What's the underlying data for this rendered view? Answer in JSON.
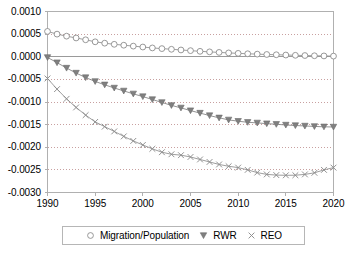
{
  "chart_data": {
    "type": "line",
    "title": "",
    "subtitle": "",
    "xlabel": "",
    "ylabel": "",
    "xlim": [
      1990,
      2020
    ],
    "ylim": [
      -0.003,
      0.001
    ],
    "grid": true,
    "legend_position": "bottom",
    "x": [
      1990,
      1991,
      1992,
      1993,
      1994,
      1995,
      1996,
      1997,
      1998,
      1999,
      2000,
      2001,
      2002,
      2003,
      2004,
      2005,
      2006,
      2007,
      2008,
      2009,
      2010,
      2011,
      2012,
      2013,
      2014,
      2015,
      2016,
      2017,
      2018,
      2019,
      2020
    ],
    "xticks": [
      1990,
      1995,
      2000,
      2005,
      2010,
      2015,
      2020
    ],
    "xtick_labels": [
      "1990",
      "1995",
      "2000",
      "2005",
      "2010",
      "2015",
      "2020"
    ],
    "yticks": [
      0.001,
      0.0005,
      0.0,
      -0.0005,
      -0.001,
      -0.0015,
      -0.002,
      -0.0025,
      -0.003
    ],
    "ytick_labels": [
      "0.0010",
      "0.0005",
      "0.0000",
      "-0.0005",
      "-0.0010",
      "-0.0015",
      "-0.0020",
      "-0.0025",
      "-0.0030"
    ],
    "series": [
      {
        "name": "Migration/Population",
        "marker": "open-circle",
        "color": "#8c8c8c",
        "values": [
          0.00056,
          0.0005,
          0.000455,
          0.000415,
          0.000375,
          0.00033,
          0.0003,
          0.000275,
          0.000255,
          0.000235,
          0.000215,
          0.000195,
          0.00018,
          0.000165,
          0.00015,
          0.000135,
          0.00012,
          0.000108,
          9.6e-05,
          8.5e-05,
          7.5e-05,
          6.6e-05,
          5.8e-05,
          5e-05,
          4.4e-05,
          3.8e-05,
          3.2e-05,
          2.7e-05,
          2.2e-05,
          1.8e-05,
          1.4e-05
        ]
      },
      {
        "name": "RWR",
        "marker": "filled-triangle-down",
        "color": "#808080",
        "values": [
          -1.5e-05,
          -0.00013,
          -0.00025,
          -0.00036,
          -0.00046,
          -0.000545,
          -0.00062,
          -0.00069,
          -0.000755,
          -0.00082,
          -0.00088,
          -0.000945,
          -0.00101,
          -0.001075,
          -0.00113,
          -0.00119,
          -0.001245,
          -0.0013,
          -0.00135,
          -0.001395,
          -0.001425,
          -0.001448,
          -0.001462,
          -0.001478,
          -0.001492,
          -0.001508,
          -0.00152,
          -0.00153,
          -0.00154,
          -0.001548,
          -0.001552
        ]
      },
      {
        "name": "REO",
        "marker": "x-cross",
        "color": "#8c8c8c",
        "values": [
          -0.00048,
          -0.000715,
          -0.00093,
          -0.00112,
          -0.00129,
          -0.00144,
          -0.001545,
          -0.00165,
          -0.00176,
          -0.00186,
          -0.00195,
          -0.002035,
          -0.00211,
          -0.002155,
          -0.002175,
          -0.002215,
          -0.00227,
          -0.002325,
          -0.00238,
          -0.00242,
          -0.00245,
          -0.0025,
          -0.00256,
          -0.0026,
          -0.002615,
          -0.00262,
          -0.002618,
          -0.0026,
          -0.002565,
          -0.0025,
          -0.00245
        ]
      }
    ],
    "legend": [
      {
        "label": "Migration/Population",
        "marker": "open-circle",
        "color": "#8c8c8c"
      },
      {
        "label": "RWR",
        "marker": "filled-triangle-down",
        "color": "#808080"
      },
      {
        "label": "REO",
        "marker": "x-cross",
        "color": "#8c8c8c"
      }
    ],
    "colors": {
      "plot_border": "#b0b0b0",
      "gridline": "#c8a0a0",
      "zero_line": "#9a9a9a",
      "background": "#ffffff",
      "text": "#000000"
    }
  }
}
